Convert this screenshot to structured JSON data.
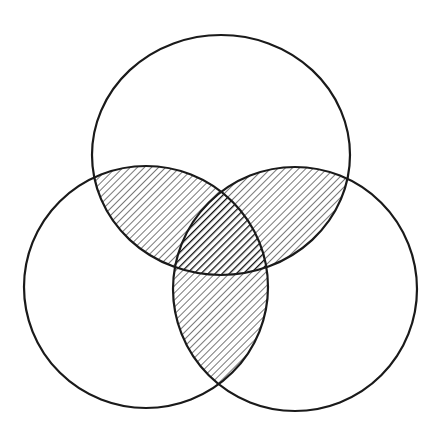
{
  "diagram": {
    "type": "venn",
    "set_count": 3,
    "background": "#ffffff",
    "stroke_color": "#1a1a1a",
    "sets": [
      {
        "id": "top",
        "cx": 221,
        "cy": 155,
        "rx": 129,
        "ry": 120
      },
      {
        "id": "left",
        "cx": 146,
        "cy": 287,
        "rx": 122,
        "ry": 121
      },
      {
        "id": "right",
        "cx": 295,
        "cy": 289,
        "rx": 122,
        "ry": 122
      }
    ],
    "regions": [
      {
        "name": "top-left-overlap",
        "sets": [
          "top",
          "left"
        ],
        "fill": "light-diagonal-hatch"
      },
      {
        "name": "top-right-overlap",
        "sets": [
          "top",
          "right"
        ],
        "fill": "light-diagonal-hatch"
      },
      {
        "name": "left-right-overlap",
        "sets": [
          "left",
          "right"
        ],
        "fill": "light-diagonal-hatch"
      },
      {
        "name": "triple-overlap",
        "sets": [
          "top",
          "left",
          "right"
        ],
        "fill": "dense-dark-diagonal-hatch"
      }
    ],
    "hatch": {
      "light_color": "#555555",
      "dark_color": "#111111"
    }
  }
}
